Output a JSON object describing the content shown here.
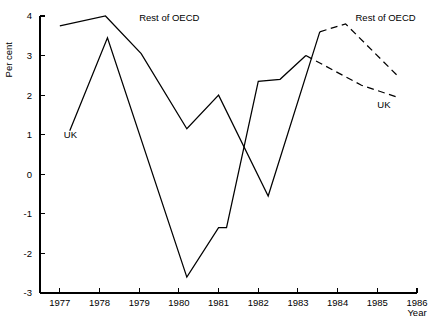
{
  "chart_data": {
    "type": "line",
    "title": "",
    "xlabel": "Year",
    "ylabel": "Per cent",
    "xlim": [
      1976.5,
      1986
    ],
    "ylim": [
      -3,
      4
    ],
    "grid": false,
    "legend_position": "inline-annotations",
    "x_ticks": [
      "1977",
      "1978",
      "1979",
      "1980",
      "1981",
      "1982",
      "1983",
      "1984",
      "1985",
      "1986"
    ],
    "x_tick_values": [
      1977,
      1978,
      1979,
      1980,
      1981,
      1982,
      1983,
      1984,
      1985,
      1986
    ],
    "y_ticks": [
      "4",
      "3",
      "2",
      "1",
      "0",
      "-1",
      "-2",
      "-3"
    ],
    "y_tick_values": [
      4,
      3,
      2,
      1,
      0,
      -1,
      -2,
      -3
    ],
    "series": [
      {
        "name": "Rest of OECD",
        "style": "solid",
        "label": "Rest of OECD",
        "label_x": 1979.0,
        "label_y": 3.95,
        "points": [
          [
            1977.0,
            3.75
          ],
          [
            1978.15,
            4.0
          ],
          [
            1979.05,
            3.05
          ],
          [
            1980.2,
            1.15
          ],
          [
            1981.0,
            2.0
          ],
          [
            1982.25,
            -0.55
          ],
          [
            1983.55,
            3.6
          ]
        ]
      },
      {
        "name": "Rest of OECD (projection)",
        "style": "dashed",
        "label": "Rest of OECD",
        "label_x": 1984.45,
        "label_y": 3.95,
        "points": [
          [
            1983.55,
            3.6
          ],
          [
            1984.2,
            3.8
          ],
          [
            1985.55,
            2.45
          ]
        ]
      },
      {
        "name": "UK",
        "style": "solid",
        "label": "UK",
        "label_x": 1977.1,
        "label_y": 1.0,
        "points": [
          [
            1977.25,
            1.1
          ],
          [
            1978.2,
            3.45
          ],
          [
            1980.2,
            -2.6
          ],
          [
            1981.0,
            -1.35
          ],
          [
            1981.2,
            -1.35
          ],
          [
            1982.0,
            2.35
          ],
          [
            1982.55,
            2.4
          ],
          [
            1983.2,
            3.0
          ]
        ]
      },
      {
        "name": "UK (projection)",
        "style": "dashed",
        "label": "UK",
        "label_x": 1985.0,
        "label_y": 1.75,
        "points": [
          [
            1983.2,
            3.0
          ],
          [
            1984.6,
            2.25
          ],
          [
            1985.5,
            1.95
          ]
        ]
      }
    ]
  }
}
